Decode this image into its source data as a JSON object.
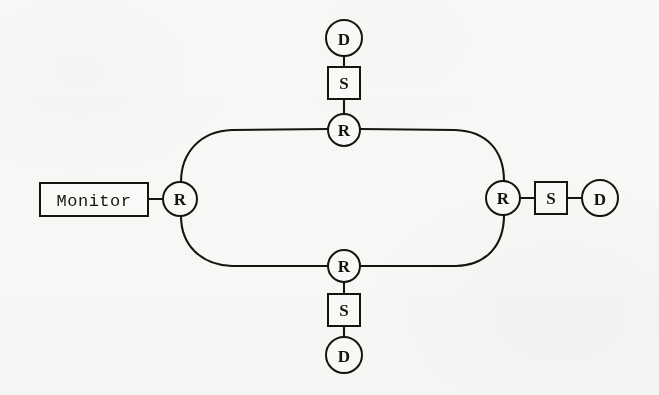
{
  "figure": {
    "type": "network-diagram",
    "topology": "ring",
    "background_color": "#f9f9f8",
    "ink_color": "#17140f",
    "width": 659,
    "height": 395
  },
  "legend_keys": {
    "R": "R",
    "S": "S",
    "D": "D"
  },
  "monitor": {
    "label": "Monitor",
    "shape": "rectangle",
    "x": 40,
    "y": 183,
    "width": 108,
    "height": 33
  },
  "nodes": [
    {
      "id": "r-left",
      "label": "R",
      "shape": "circle",
      "cx": 180,
      "cy": 199,
      "r": 17
    },
    {
      "id": "r-top",
      "label": "R",
      "shape": "circle",
      "cx": 344,
      "cy": 130,
      "r": 16
    },
    {
      "id": "r-right",
      "label": "R",
      "shape": "circle",
      "cx": 503,
      "cy": 198,
      "r": 17
    },
    {
      "id": "r-bottom",
      "label": "R",
      "shape": "circle",
      "cx": 344,
      "cy": 266,
      "r": 16
    },
    {
      "id": "s-top",
      "label": "S",
      "shape": "square",
      "cx": 344,
      "cy": 83,
      "size": 32
    },
    {
      "id": "s-right",
      "label": "S",
      "shape": "square",
      "cx": 551,
      "cy": 198,
      "size": 32
    },
    {
      "id": "s-bottom",
      "label": "S",
      "shape": "square",
      "cx": 344,
      "cy": 310,
      "size": 32
    },
    {
      "id": "d-top",
      "label": "D",
      "shape": "circle",
      "cx": 344,
      "cy": 38,
      "r": 18
    },
    {
      "id": "d-right",
      "label": "D",
      "shape": "circle",
      "cx": 600,
      "cy": 198,
      "r": 18
    },
    {
      "id": "d-bottom",
      "label": "D",
      "shape": "circle",
      "cx": 344,
      "cy": 355,
      "r": 18
    }
  ],
  "links": [
    {
      "id": "link-monitor-rleft",
      "from": "monitor",
      "to": "r-left",
      "kind": "straight"
    },
    {
      "id": "link-dtop-stop",
      "from": "d-top",
      "to": "s-top",
      "kind": "straight"
    },
    {
      "id": "link-stop-rtop",
      "from": "s-top",
      "to": "r-top",
      "kind": "straight"
    },
    {
      "id": "link-rright-sright",
      "from": "r-right",
      "to": "s-right",
      "kind": "straight"
    },
    {
      "id": "link-sright-dright",
      "from": "s-right",
      "to": "d-right",
      "kind": "straight"
    },
    {
      "id": "link-rbottom-sbottom",
      "from": "r-bottom",
      "to": "s-bottom",
      "kind": "straight"
    },
    {
      "id": "link-sbottom-dbottom",
      "from": "s-bottom",
      "to": "d-bottom",
      "kind": "straight"
    },
    {
      "id": "ring-upper-left",
      "from": "r-left",
      "to": "r-top",
      "kind": "curved"
    },
    {
      "id": "ring-upper-right",
      "from": "r-top",
      "to": "r-right",
      "kind": "curved"
    },
    {
      "id": "ring-lower-right",
      "from": "r-right",
      "to": "r-bottom",
      "kind": "curved"
    },
    {
      "id": "ring-lower-left",
      "from": "r-bottom",
      "to": "r-left",
      "kind": "curved"
    }
  ]
}
